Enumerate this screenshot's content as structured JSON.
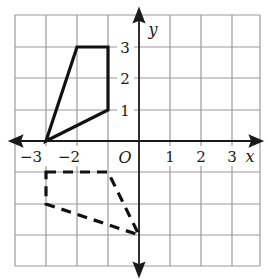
{
  "diagram": {
    "type": "coordinate-grid",
    "x_axis_label": "x",
    "y_axis_label": "y",
    "origin_label": "O",
    "x_range": [
      -4,
      4
    ],
    "y_range": [
      -4,
      4
    ],
    "x_tick_labels": [
      {
        "value": -3,
        "text": "−3"
      },
      {
        "value": -2,
        "text": "−2"
      },
      {
        "value": 1,
        "text": "1"
      },
      {
        "value": 2,
        "text": "2"
      },
      {
        "value": 3,
        "text": "3"
      }
    ],
    "y_tick_labels": [
      {
        "value": 1,
        "text": "1"
      },
      {
        "value": 2,
        "text": "2"
      },
      {
        "value": 3,
        "text": "3"
      }
    ],
    "shapes": [
      {
        "name": "solid-quadrilateral",
        "style": "solid",
        "vertices": [
          [
            -3,
            0
          ],
          [
            -2,
            3
          ],
          [
            -1,
            3
          ],
          [
            -1,
            1
          ]
        ]
      },
      {
        "name": "dashed-quadrilateral",
        "style": "dashed",
        "vertices": [
          [
            -3,
            -1
          ],
          [
            -1,
            -1
          ],
          [
            0,
            -3
          ],
          [
            -3,
            -2
          ]
        ]
      }
    ],
    "colors": {
      "grid": "#9a9a9a",
      "axis": "#1a1a1a",
      "shape": "#111111",
      "background": "#ffffff"
    }
  }
}
